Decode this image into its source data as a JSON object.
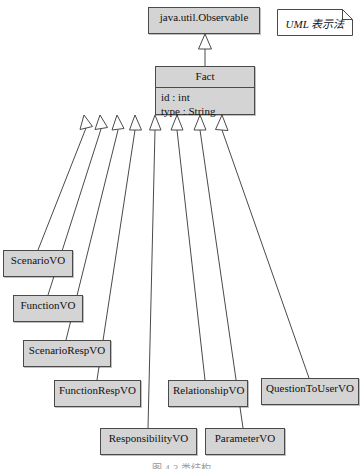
{
  "diagram": {
    "title_caption": "图 4-3  类结构",
    "stroke_color": "#4a4a4a",
    "class_fill_color": "#d4d4d4",
    "note_fill_color": "#ffffff",
    "background_color": "#ffffff",
    "relationship_type": "generalization",
    "arrow_head": "hollow-triangle"
  },
  "note": {
    "name": "uml-notation-note",
    "text": "UML 表示法"
  },
  "superclass": {
    "name": "java.util.Observable",
    "label": "java.util.Observable"
  },
  "base_class": {
    "name": "Fact",
    "label": "Fact",
    "attributes": [
      "id : int",
      "type : String"
    ]
  },
  "subclasses": [
    {
      "id": "scenariovo",
      "label": "ScenarioVO"
    },
    {
      "id": "functionvo",
      "label": "FunctionVO"
    },
    {
      "id": "scenariorespvo",
      "label": "ScenarioRespVO"
    },
    {
      "id": "functionrespvo",
      "label": "FunctionRespVO"
    },
    {
      "id": "responsibilityvo",
      "label": "ResponsibilityVO"
    },
    {
      "id": "relationshipvo",
      "label": "RelationshipVO"
    },
    {
      "id": "parametervo",
      "label": "ParameterVO"
    },
    {
      "id": "questiontouservo",
      "label": "QuestionToUserVO"
    }
  ]
}
